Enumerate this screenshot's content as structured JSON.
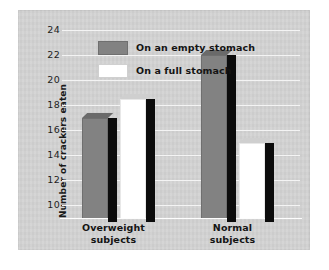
{
  "chart_data": {
    "type": "bar",
    "title": "",
    "xlabel": "",
    "ylabel": "Number of crackers eaten",
    "categories": [
      "Overweight subjects",
      "Normal subjects"
    ],
    "category_lines": [
      [
        "Overweight",
        "subjects"
      ],
      [
        "Normal",
        "subjects"
      ]
    ],
    "series": [
      {
        "name": "On an empty stomach",
        "values": [
          17,
          22
        ],
        "color": "#828282"
      },
      {
        "name": "On a full stomach",
        "values": [
          18.5,
          15
        ],
        "color": "#ffffff"
      }
    ],
    "ylim": [
      9,
      24
    ],
    "yticks": [
      24,
      22,
      20,
      18,
      16,
      14,
      12,
      10
    ],
    "ytick_labels": [
      "24",
      "22",
      "20",
      "18",
      "16",
      "14",
      "12",
      "10"
    ],
    "grid": true,
    "legend_position": "upper-left-inside",
    "panel_background": "#d3d3d3",
    "gridline_color": "#f4f4f4",
    "shadow_color": "#0c0c0c"
  },
  "legend": {
    "items": [
      {
        "label": "On an empty stomach",
        "swatch": "gray"
      },
      {
        "label": "On a full stomach",
        "swatch": "white"
      }
    ]
  }
}
